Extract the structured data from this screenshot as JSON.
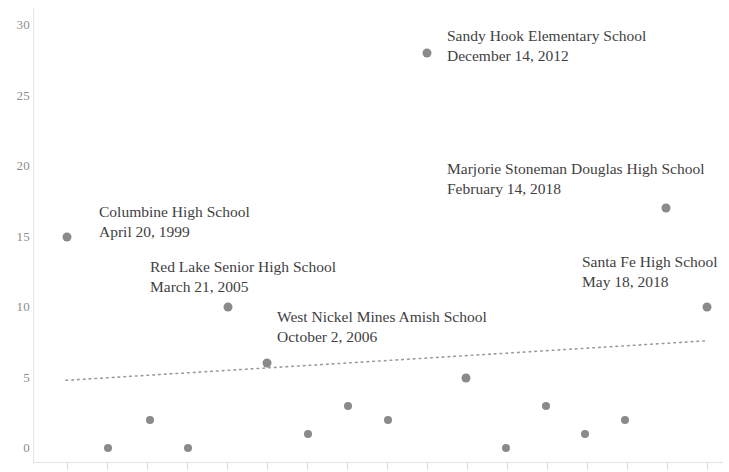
{
  "chart_data": {
    "type": "scatter",
    "title": "",
    "xlabel": "",
    "ylabel": "",
    "ylim": [
      0,
      30
    ],
    "yticks": [
      0,
      5,
      10,
      15,
      20,
      25,
      30
    ],
    "ytick_labels": [
      "0",
      "5",
      "10",
      "15",
      "20",
      "25",
      "30"
    ],
    "grid": false,
    "legend": "none",
    "marker_color": "#8a8a8a",
    "trendline": {
      "style": "dotted",
      "color": "#9a9a9a",
      "y_start": 4.8,
      "y_end": 7.6
    },
    "points": [
      {
        "label": "Columbine High School",
        "date": "April 20, 1999",
        "x_px": 67,
        "value": 15
      },
      {
        "label": "",
        "date": "",
        "x_px": 108,
        "value": 0
      },
      {
        "label": "",
        "date": "",
        "x_px": 150,
        "value": 2
      },
      {
        "label": "",
        "date": "",
        "x_px": 188,
        "value": 0
      },
      {
        "label": "Red Lake Senior High School",
        "date": "March 21, 2005",
        "x_px": 228,
        "value": 10
      },
      {
        "label": "West Nickel Mines Amish School",
        "date": "October 2, 2006",
        "x_px": 267,
        "value": 6
      },
      {
        "label": "",
        "date": "",
        "x_px": 308,
        "value": 1
      },
      {
        "label": "",
        "date": "",
        "x_px": 348,
        "value": 3
      },
      {
        "label": "",
        "date": "",
        "x_px": 388,
        "value": 2
      },
      {
        "label": "Sandy Hook Elementary School",
        "date": "December 14, 2012",
        "x_px": 427,
        "value": 28
      },
      {
        "label": "",
        "date": "",
        "x_px": 466,
        "value": 5
      },
      {
        "label": "",
        "date": "",
        "x_px": 506,
        "value": 0
      },
      {
        "label": "",
        "date": "",
        "x_px": 546,
        "value": 3
      },
      {
        "label": "",
        "date": "",
        "x_px": 585,
        "value": 1
      },
      {
        "label": "",
        "date": "",
        "x_px": 625,
        "value": 2
      },
      {
        "label": "Marjorie Stoneman Douglas High School",
        "date": "February 14, 2018",
        "x_px": 666,
        "value": 17
      },
      {
        "label": "Santa Fe High School",
        "date": "May 18, 2018",
        "x_px": 707,
        "value": 10
      }
    ],
    "annotations": [
      {
        "name": "sandy-hook",
        "line1": "Sandy Hook Elementary School",
        "line2": "December 14, 2012",
        "left": 447,
        "top": 26,
        "align": "left"
      },
      {
        "name": "marjorie-stoneman-douglas",
        "line1": "Marjorie Stoneman Douglas High School",
        "line2": "February 14, 2018",
        "left": 447,
        "top": 159,
        "align": "left"
      },
      {
        "name": "columbine",
        "line1": "Columbine High School",
        "line2": "April 20, 1999",
        "left": 99,
        "top": 202,
        "align": "left"
      },
      {
        "name": "santa-fe",
        "line1": "Santa Fe High School",
        "line2": "May 18, 2018",
        "left": 582,
        "top": 252,
        "align": "left"
      },
      {
        "name": "red-lake",
        "line1": "Red Lake Senior High School",
        "line2": "March 21, 2005",
        "left": 150,
        "top": 257,
        "align": "left"
      },
      {
        "name": "west-nickel-mines",
        "line1": "West Nickel Mines Amish School",
        "line2": "October 2, 2006",
        "left": 277,
        "top": 307,
        "align": "left"
      }
    ]
  }
}
